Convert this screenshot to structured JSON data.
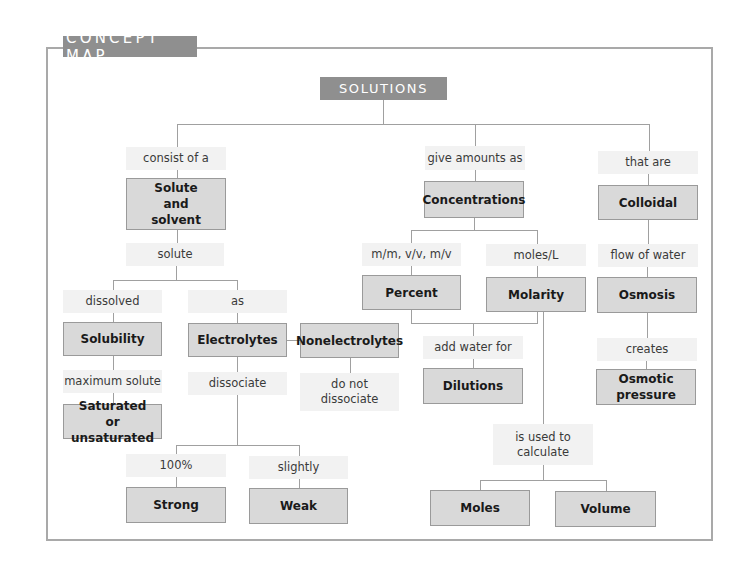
{
  "header": {
    "title": "CONCEPT MAP"
  },
  "root": {
    "label": "SOLUTIONS"
  },
  "branches": {
    "left": {
      "link": "consist of a",
      "node": "Solute and solvent",
      "sublink": "solute",
      "dissolved": {
        "link": "dissolved",
        "node": "Solubility",
        "link2": "maximum solute",
        "node2": "Saturated or unsaturated"
      },
      "as": {
        "link": "as",
        "node": "Electrolytes",
        "link2": "dissociate",
        "nonelectrolytes": {
          "node": "Nonelectrolytes",
          "link": "do not dissociate"
        },
        "strong": {
          "link": "100%",
          "node": "Strong"
        },
        "weak": {
          "link": "slightly",
          "node": "Weak"
        }
      }
    },
    "middle": {
      "link": "give amounts as",
      "node": "Concentrations",
      "percent": {
        "link": "m/m, v/v, m/v",
        "node": "Percent"
      },
      "molarity": {
        "link": "moles/L",
        "node": "Molarity"
      },
      "dilutions": {
        "link": "add water for",
        "node": "Dilutions"
      },
      "calculate": {
        "link": "is used to calculate",
        "moles": "Moles",
        "volume": "Volume"
      }
    },
    "right": {
      "link": "that are",
      "node": "Colloidal",
      "link2": "flow of water",
      "node2": "Osmosis",
      "link3": "creates",
      "node3": "Osmotic pressure"
    }
  },
  "colors": {
    "header_bg": "#8f8f8f",
    "node_bg": "#d9d9d9",
    "link_bg": "#f2f2f2",
    "frame": "#a9a9a9"
  }
}
